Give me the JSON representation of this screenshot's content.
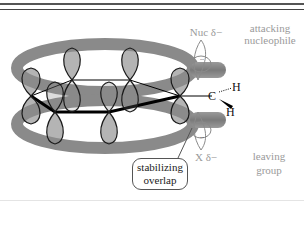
{
  "diagram": {
    "type": "orbital-interaction",
    "labels": {
      "nucleophile_charge": "Nuc δ−",
      "nucleophile_role_line1": "attacking",
      "nucleophile_role_line2": "nucleophile",
      "leaving_charge": "X δ−",
      "leaving_role_line1": "leaving",
      "leaving_role_line2": "group",
      "carbon": "C",
      "hydrogen_top": "H",
      "hydrogen_bottom": "H",
      "callout_line1": "stabilizing",
      "callout_line2": "overlap"
    },
    "lone_pair_symbol": "..",
    "colors": {
      "orbital_fill": "#8c8c8c",
      "orbital_outline": "#1a1a1a",
      "label_gray": "#9a9a9a",
      "ring_bond": "#000000"
    }
  }
}
